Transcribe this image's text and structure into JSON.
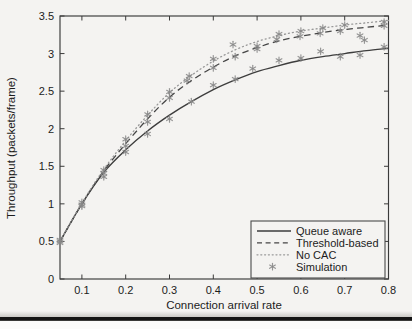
{
  "page": {
    "background": "#f4f3f1",
    "divider_color": "#151515"
  },
  "chart_data": {
    "type": "line",
    "title": "",
    "xlabel": "Connection arrival rate",
    "ylabel": "Throughput (packets/frame)",
    "xlim": [
      0.05,
      0.8
    ],
    "ylim": [
      0,
      3.5
    ],
    "x_ticks": [
      0.1,
      0.2,
      0.3,
      0.4,
      0.5,
      0.6,
      0.7,
      0.8
    ],
    "y_ticks": [
      0,
      0.5,
      1,
      1.5,
      2,
      2.5,
      3,
      3.5
    ],
    "grid": false,
    "legend_position": "lower right",
    "axis_color": "#3a3a3a",
    "x": [
      0.05,
      0.1,
      0.15,
      0.2,
      0.25,
      0.3,
      0.35,
      0.4,
      0.45,
      0.5,
      0.55,
      0.6,
      0.65,
      0.7,
      0.75,
      0.8
    ],
    "series": [
      {
        "name": "Queue aware",
        "style": "solid",
        "color": "#3d3d3d",
        "values": [
          0.5,
          1.0,
          1.42,
          1.72,
          1.97,
          2.18,
          2.36,
          2.52,
          2.65,
          2.76,
          2.84,
          2.91,
          2.96,
          3.0,
          3.04,
          3.07
        ]
      },
      {
        "name": "Threshold-based",
        "style": "dashed",
        "color": "#454545",
        "values": [
          0.5,
          1.0,
          1.44,
          1.8,
          2.13,
          2.42,
          2.64,
          2.82,
          2.97,
          3.08,
          3.17,
          3.23,
          3.28,
          3.32,
          3.35,
          3.38
        ]
      },
      {
        "name": "No CAC",
        "style": "dotted",
        "color": "#999999",
        "values": [
          0.5,
          1.01,
          1.46,
          1.84,
          2.18,
          2.48,
          2.71,
          2.9,
          3.05,
          3.16,
          3.24,
          3.3,
          3.34,
          3.38,
          3.41,
          3.44
        ]
      }
    ],
    "scatter": {
      "name": "Simulation",
      "marker": "*",
      "color": "#898989",
      "points": [
        [
          0.05,
          0.48
        ],
        [
          0.1,
          0.97
        ],
        [
          0.15,
          1.36
        ],
        [
          0.2,
          1.69
        ],
        [
          0.25,
          1.93
        ],
        [
          0.3,
          2.13
        ],
        [
          0.35,
          2.36
        ],
        [
          0.4,
          2.58
        ],
        [
          0.45,
          2.66
        ],
        [
          0.49,
          2.8
        ],
        [
          0.55,
          2.91
        ],
        [
          0.6,
          2.94
        ],
        [
          0.645,
          3.03
        ],
        [
          0.69,
          2.96
        ],
        [
          0.735,
          2.98
        ],
        [
          0.79,
          3.09
        ],
        [
          0.05,
          0.5
        ],
        [
          0.1,
          0.99
        ],
        [
          0.15,
          1.41
        ],
        [
          0.2,
          1.77
        ],
        [
          0.25,
          2.09
        ],
        [
          0.3,
          2.41
        ],
        [
          0.34,
          2.64
        ],
        [
          0.4,
          2.81
        ],
        [
          0.45,
          2.96
        ],
        [
          0.5,
          3.06
        ],
        [
          0.545,
          3.19
        ],
        [
          0.598,
          3.23
        ],
        [
          0.644,
          3.27
        ],
        [
          0.69,
          3.3
        ],
        [
          0.735,
          3.24
        ],
        [
          0.79,
          3.37
        ],
        [
          0.05,
          0.52
        ],
        [
          0.1,
          1.02
        ],
        [
          0.15,
          1.45
        ],
        [
          0.2,
          1.86
        ],
        [
          0.25,
          2.19
        ],
        [
          0.3,
          2.49
        ],
        [
          0.345,
          2.7
        ],
        [
          0.4,
          2.93
        ],
        [
          0.445,
          3.12
        ],
        [
          0.5,
          3.1
        ],
        [
          0.55,
          3.26
        ],
        [
          0.6,
          3.3
        ],
        [
          0.65,
          3.34
        ],
        [
          0.7,
          3.38
        ],
        [
          0.745,
          3.18
        ],
        [
          0.79,
          3.42
        ]
      ]
    },
    "legend_labels": [
      "Queue aware",
      "Threshold-based",
      "No CAC",
      "Simulation"
    ]
  }
}
